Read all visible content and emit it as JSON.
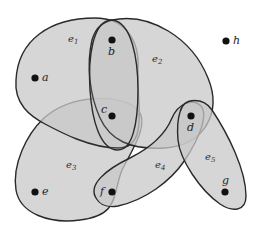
{
  "diagram": {
    "type": "hypergraph",
    "vertices": [
      {
        "id": "a",
        "label": "a",
        "x": 35,
        "y": 78
      },
      {
        "id": "b",
        "label": "b",
        "x": 112,
        "y": 40
      },
      {
        "id": "c",
        "label": "c",
        "x": 112,
        "y": 116
      },
      {
        "id": "d",
        "label": "d",
        "x": 191,
        "y": 116
      },
      {
        "id": "e",
        "label": "e",
        "x": 35,
        "y": 192
      },
      {
        "id": "f",
        "label": "f",
        "x": 112,
        "y": 192
      },
      {
        "id": "g",
        "label": "g",
        "x": 225,
        "y": 192
      },
      {
        "id": "h",
        "label": "h",
        "x": 226,
        "y": 41
      }
    ],
    "hyperedges": [
      {
        "id": "e1",
        "label": "e",
        "sub": "1",
        "members": [
          "a",
          "b",
          "c"
        ]
      },
      {
        "id": "e2",
        "label": "e",
        "sub": "2",
        "members": [
          "b",
          "c",
          "d"
        ]
      },
      {
        "id": "e3",
        "label": "e",
        "sub": "3",
        "members": [
          "c",
          "e",
          "f"
        ]
      },
      {
        "id": "e4",
        "label": "e",
        "sub": "4",
        "members": [
          "d",
          "f"
        ]
      },
      {
        "id": "e5",
        "label": "e",
        "sub": "5",
        "members": [
          "d",
          "g"
        ]
      }
    ],
    "isolated_vertices": [
      "h"
    ],
    "colors": {
      "fill": "#c8c8c8",
      "stroke": "#2a2a2a",
      "vertex": "#111111"
    }
  }
}
